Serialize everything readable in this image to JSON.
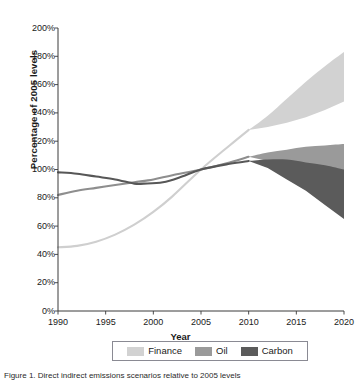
{
  "chart_data": {
    "type": "area",
    "title": "",
    "xlabel": "Year",
    "ylabel": "Percentage of 2005 levels",
    "xlim": [
      1990,
      2020
    ],
    "ylim": [
      0,
      200
    ],
    "grid": false,
    "legend_position": "bottom",
    "x_ticks": [
      "1990",
      "1995",
      "2000",
      "2005",
      "2010",
      "2015",
      "2020"
    ],
    "x_tick_values": [
      1990,
      1995,
      2000,
      2005,
      2010,
      2015,
      2020
    ],
    "y_ticks": [
      "0%",
      "20%",
      "40%",
      "60%",
      "80%",
      "100%",
      "120%",
      "140%",
      "160%",
      "180%",
      "200%"
    ],
    "y_tick_values": [
      0,
      20,
      40,
      60,
      80,
      100,
      120,
      140,
      160,
      180,
      200
    ],
    "note": "Three series shown as historical single lines 1990-2010 converging at 100% in 2005, then fanning into uncertainty bands through 2020",
    "series": [
      {
        "name": "Finance",
        "color": "#d2d2d2",
        "line_color": "#cfcfcf",
        "historical_x": [
          1990,
          1992,
          1994,
          1996,
          1998,
          2000,
          2002,
          2005,
          2008,
          2010
        ],
        "historical_values": [
          45,
          46,
          49,
          54,
          61,
          70,
          81,
          100,
          117,
          128
        ],
        "band_x": [
          2010,
          2012,
          2014,
          2016,
          2018,
          2020
        ],
        "band_upper": [
          128,
          138,
          150,
          162,
          173,
          183
        ],
        "band_lower": [
          128,
          130,
          133,
          137,
          142,
          148
        ]
      },
      {
        "name": "Oil",
        "color": "#9a9a9a",
        "line_color": "#8e8e8e",
        "historical_x": [
          1990,
          1992,
          1994,
          1996,
          1998,
          2000,
          2002,
          2005,
          2008,
          2010
        ],
        "historical_values": [
          82,
          85,
          87,
          89,
          91,
          93,
          96,
          100,
          105,
          109
        ],
        "band_x": [
          2010,
          2012,
          2014,
          2016,
          2018,
          2020
        ],
        "band_upper": [
          109,
          112,
          114,
          116,
          117,
          118
        ],
        "band_lower": [
          109,
          106,
          101,
          95,
          89,
          82
        ]
      },
      {
        "name": "Carbon",
        "color": "#5b5b5b",
        "line_color": "#575757",
        "historical_x": [
          1990,
          1992,
          1994,
          1996,
          1998,
          1999,
          2001,
          2003,
          2005,
          2008,
          2010
        ],
        "historical_values": [
          98,
          97,
          95,
          93,
          90,
          90,
          91,
          95,
          100,
          104,
          106
        ],
        "band_x": [
          2010,
          2012,
          2014,
          2016,
          2018,
          2020
        ],
        "band_upper": [
          106,
          107,
          107,
          105,
          103,
          100
        ],
        "band_lower": [
          106,
          101,
          93,
          85,
          75,
          65
        ]
      }
    ],
    "legend": [
      {
        "label": "Finance",
        "color": "#d2d2d2"
      },
      {
        "label": "Oil",
        "color": "#9a9a9a"
      },
      {
        "label": "Carbon",
        "color": "#5b5b5b"
      }
    ]
  },
  "axes": {
    "y_title": "Percentage of 2005 levels",
    "x_title": "Year"
  },
  "caption": {
    "text": "Figure 1. Direct indirect emissions scenarios relative to 2005 levels"
  }
}
